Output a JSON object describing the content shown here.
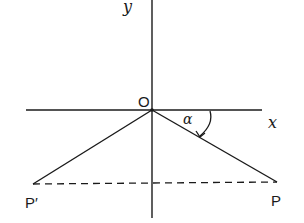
{
  "diagram": {
    "type": "coordinate-geometry",
    "colors": {
      "stroke": "#1a1a1a",
      "background": "#ffffff"
    },
    "labels": {
      "y_axis": "y",
      "x_axis": "x",
      "origin": "O",
      "angle": "α",
      "point_p": "P",
      "point_p_prime": "P′"
    },
    "points": {
      "O": [
        152,
        110
      ],
      "P": [
        277,
        182
      ],
      "P_prime": [
        33,
        184
      ]
    }
  }
}
